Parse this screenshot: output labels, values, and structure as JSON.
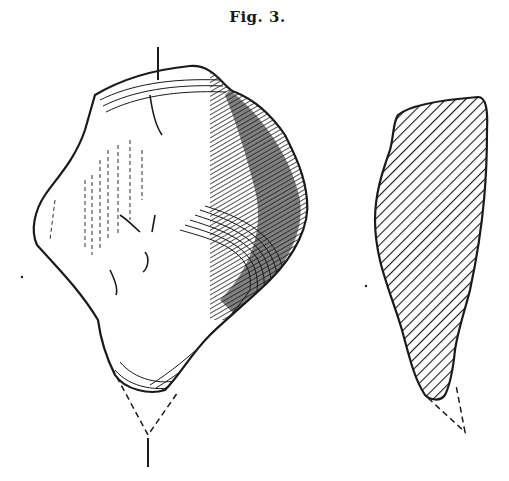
{
  "figure": {
    "caption": "Fig. 3.",
    "views": [
      {
        "name": "exterior-view",
        "description": "shaded drawing of fragment with dashed reconstructed tip"
      },
      {
        "name": "cross-section",
        "description": "hatched section outline with dashed reconstructed tip"
      }
    ],
    "colors": {
      "ink": "#1a1a1a",
      "paper": "#ffffff"
    }
  }
}
